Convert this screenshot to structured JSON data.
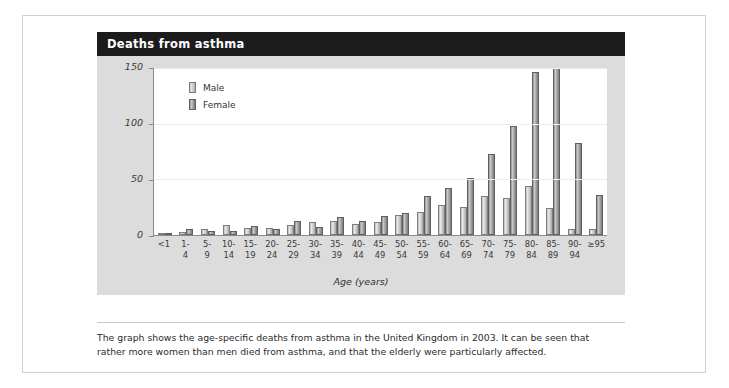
{
  "card": {
    "title": "Deaths from asthma"
  },
  "caption": "The graph shows the age-specific deaths from asthma in the United Kingdom in 2003. It can be seen that rather more women than men died from asthma, and that the elderly were particularly affected.",
  "chart_data": {
    "type": "bar",
    "title": "Deaths from asthma",
    "xlabel": "Age (years)",
    "ylabel": "",
    "ylim": [
      0,
      150
    ],
    "yticks": [
      0,
      50,
      100,
      150
    ],
    "grid": true,
    "legend_position": "top-left",
    "categories": [
      "<1",
      "1-4",
      "5-9",
      "10-14",
      "15-19",
      "20-24",
      "25-29",
      "30-34",
      "35-39",
      "40-44",
      "45-49",
      "50-54",
      "55-59",
      "60-64",
      "65-69",
      "70-74",
      "75-79",
      "80-84",
      "85-89",
      "90-94",
      "≥95"
    ],
    "category_lines": [
      [
        "<1",
        ""
      ],
      [
        "1-",
        "4"
      ],
      [
        "5-",
        "9"
      ],
      [
        "10-",
        "14"
      ],
      [
        "15-",
        "19"
      ],
      [
        "20-",
        "24"
      ],
      [
        "25-",
        "29"
      ],
      [
        "30-",
        "34"
      ],
      [
        "35-",
        "39"
      ],
      [
        "40-",
        "44"
      ],
      [
        "45-",
        "49"
      ],
      [
        "50-",
        "54"
      ],
      [
        "55-",
        "59"
      ],
      [
        "60-",
        "64"
      ],
      [
        "65-",
        "69"
      ],
      [
        "70-",
        "74"
      ],
      [
        "75-",
        "79"
      ],
      [
        "80-",
        "84"
      ],
      [
        "85-",
        "89"
      ],
      [
        "90-",
        "94"
      ],
      [
        "≥95",
        ""
      ]
    ],
    "series": [
      {
        "name": "Male",
        "values": [
          1,
          3,
          5,
          9,
          6,
          6,
          9,
          12,
          13,
          10,
          12,
          18,
          21,
          27,
          25,
          35,
          33,
          44,
          24,
          5,
          5
        ]
      },
      {
        "name": "Female",
        "values": [
          1,
          5,
          4,
          4,
          8,
          5,
          13,
          7,
          16,
          13,
          17,
          20,
          35,
          42,
          51,
          73,
          98,
          146,
          150,
          83,
          36
        ]
      }
    ]
  }
}
